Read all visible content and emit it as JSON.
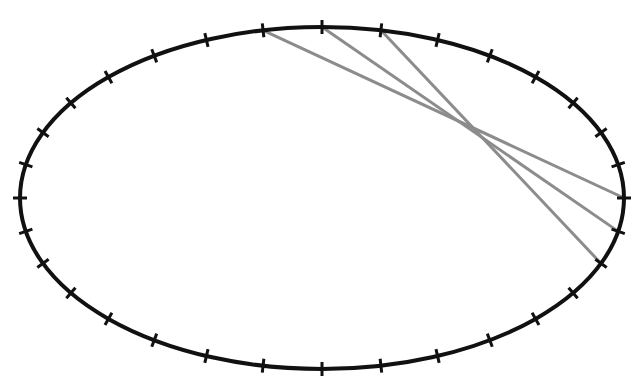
{
  "diagram": {
    "ellipse": {
      "cx": 322,
      "cy": 198,
      "rx": 302,
      "ry": 171,
      "stroke": "#111111",
      "stroke_width": 4
    },
    "ticks": {
      "count": 32,
      "length": 14,
      "stroke": "#111111",
      "stroke_width": 3
    },
    "chords": {
      "stroke": "#8c8c8c",
      "stroke_width": 3,
      "pairs": [
        {
          "from_index": 9,
          "to_index": 0
        },
        {
          "from_index": 8,
          "to_index": 31
        },
        {
          "from_index": 7,
          "to_index": 30
        }
      ]
    }
  }
}
